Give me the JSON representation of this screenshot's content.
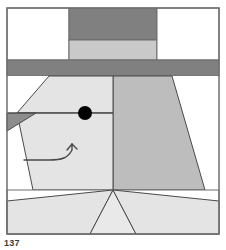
{
  "figure": {
    "caption_fragment": "137",
    "canvas": {
      "width": 226,
      "height": 250
    },
    "border": {
      "color": "#707070",
      "width": 1
    }
  },
  "palette": {
    "background": "#ffffff",
    "white_patch": "#ffffff",
    "face_light": "#e4e4e4",
    "ear_medium": "#bdbdbd",
    "hatband_light": "#c9c9c9",
    "hat_dark": "#808080",
    "brim_dark": "#808080",
    "nose_dark": "#8c8c8c",
    "outline": "#4a4a4a",
    "eye": "#000000"
  },
  "block": {
    "name": "dog-face-block",
    "frame": {
      "x": 7,
      "y": 8,
      "width": 212,
      "height": 226
    },
    "rows": [
      {
        "name": "hat-row",
        "label": "Hat crown row",
        "y_top": 8,
        "y_bottom": 60,
        "patches": [
          {
            "name": "hat-corner-left",
            "label": "Background corner left",
            "fill": "#ffffff"
          },
          {
            "name": "hat-crown",
            "label": "Hat crown",
            "fill": "#808080"
          },
          {
            "name": "hat-corner-right",
            "label": "Background corner right",
            "fill": "#ffffff"
          }
        ]
      },
      {
        "name": "hatband-row",
        "label": "Hat band row",
        "y_top": 38,
        "y_bottom": 60,
        "patches": [
          {
            "name": "hat-band",
            "label": "Hat band",
            "fill": "#c9c9c9"
          }
        ]
      },
      {
        "name": "brim-row",
        "label": "Hat brim strip",
        "y_top": 60,
        "y_bottom": 76,
        "patches": [
          {
            "name": "hat-brim",
            "label": "Hat brim",
            "fill": "#808080"
          }
        ]
      },
      {
        "name": "face-row",
        "label": "Face and ear row",
        "y_top": 76,
        "y_bottom": 190,
        "patches": [
          {
            "name": "face-corner-top-left",
            "label": "Background corner",
            "fill": "#ffffff"
          },
          {
            "name": "face-upper",
            "label": "Upper head",
            "fill": "#e4e4e4"
          },
          {
            "name": "face-lower",
            "label": "Muzzle",
            "fill": "#e4e4e4"
          },
          {
            "name": "nose-triangle",
            "label": "Nose tip",
            "fill": "#8c8c8c"
          },
          {
            "name": "ear-trapezoid",
            "label": "Ear",
            "fill": "#bdbdbd"
          },
          {
            "name": "face-corner-bottom-left",
            "label": "Background corner",
            "fill": "#ffffff"
          },
          {
            "name": "face-corner-right",
            "label": "Background corner",
            "fill": "#ffffff"
          }
        ]
      },
      {
        "name": "bottom-row",
        "label": "Bottom triangle row",
        "y_top": 190,
        "y_bottom": 234,
        "patches": [
          {
            "name": "bottom-left-triangle",
            "label": "Left side triangle",
            "fill": "#e4e4e4"
          },
          {
            "name": "bottom-center-triangle",
            "label": "Center triangle",
            "fill": "#e4e4e4"
          },
          {
            "name": "bottom-right-triangle",
            "label": "Right side triangle",
            "fill": "#e4e4e4"
          },
          {
            "name": "bottom-white-a",
            "label": "Background triangle",
            "fill": "#ffffff"
          },
          {
            "name": "bottom-white-b",
            "label": "Background triangle",
            "fill": "#ffffff"
          }
        ]
      }
    ],
    "details": [
      {
        "name": "eye",
        "label": "Eye",
        "shape": "circle",
        "cx": 85,
        "cy": 113,
        "r": 7,
        "fill": "#000000"
      },
      {
        "name": "mouth",
        "label": "Mouth / smile line",
        "shape": "path",
        "stroke": "#4a4a4a"
      },
      {
        "name": "seam-line-horizontal",
        "label": "Horizontal seam across face",
        "shape": "line",
        "y": 113
      }
    ]
  }
}
